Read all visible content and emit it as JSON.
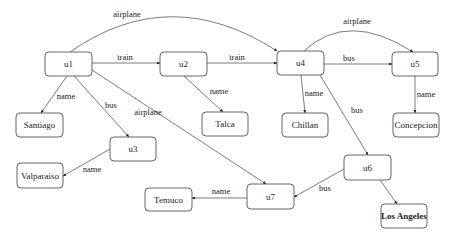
{
  "diagram": {
    "type": "graph",
    "nodes": [
      {
        "id": "u1",
        "label": "u1",
        "x": 45,
        "y": 52,
        "w": 47,
        "h": 24
      },
      {
        "id": "u2",
        "label": "u2",
        "x": 160,
        "y": 52,
        "w": 47,
        "h": 24
      },
      {
        "id": "u4",
        "label": "u4",
        "x": 277,
        "y": 51,
        "w": 47,
        "h": 24
      },
      {
        "id": "u5",
        "label": "u5",
        "x": 392,
        "y": 52,
        "w": 46,
        "h": 24
      },
      {
        "id": "santiago",
        "label": "Santiago",
        "x": 16,
        "y": 113,
        "w": 47,
        "h": 24
      },
      {
        "id": "talca",
        "label": "Talca",
        "x": 202,
        "y": 112,
        "w": 46,
        "h": 24
      },
      {
        "id": "chillan",
        "label": "Chillan",
        "x": 282,
        "y": 113,
        "w": 46,
        "h": 24
      },
      {
        "id": "concepcion",
        "label": "Concepcion",
        "x": 393,
        "y": 113,
        "w": 46,
        "h": 24
      },
      {
        "id": "u3",
        "label": "u3",
        "x": 110,
        "y": 137,
        "w": 46,
        "h": 24
      },
      {
        "id": "valparaiso",
        "label": "Valparaiso",
        "x": 17,
        "y": 163,
        "w": 46,
        "h": 25
      },
      {
        "id": "u6",
        "label": "u6",
        "x": 344,
        "y": 155,
        "w": 47,
        "h": 25
      },
      {
        "id": "u7",
        "label": "u7",
        "x": 247,
        "y": 184,
        "w": 47,
        "h": 25
      },
      {
        "id": "temuco",
        "label": "Temuco",
        "x": 145,
        "y": 188,
        "w": 47,
        "h": 23
      },
      {
        "id": "los_angeles",
        "label": "Los Angeles",
        "x": 381,
        "y": 204,
        "w": 46,
        "h": 24,
        "bold": true
      }
    ],
    "edges": [
      {
        "from": "u1",
        "to": "u4",
        "label": "airplane",
        "path": "M70,52 Q170,-18 277,51",
        "lx": 127,
        "ly": 17
      },
      {
        "from": "u1",
        "to": "u2",
        "label": "train",
        "path": "M92,63 L160,63",
        "lx": 125,
        "ly": 60
      },
      {
        "from": "u2",
        "to": "u4",
        "label": "train",
        "path": "M207,63 L277,63",
        "lx": 237,
        "ly": 60
      },
      {
        "from": "u4",
        "to": "u5",
        "label": "airplane",
        "path": "M304,51 Q348,10 413,52",
        "lx": 357,
        "ly": 24
      },
      {
        "from": "u4",
        "to": "u5",
        "label": "bus",
        "path": "M324,64 L392,64",
        "lx": 349,
        "ly": 61
      },
      {
        "from": "u1",
        "to": "santiago",
        "label": "name",
        "path": "M67,76 L41,113",
        "lx": 66,
        "ly": 99
      },
      {
        "from": "u1",
        "to": "u3",
        "label": "bus",
        "path": "M74,76 L129,137",
        "lx": 111,
        "ly": 108
      },
      {
        "from": "u1",
        "to": "u7",
        "label": "airplane",
        "path": "M92,70 L266,184",
        "lx": 148,
        "ly": 115
      },
      {
        "from": "u2",
        "to": "talca",
        "label": "name",
        "path": "M184,76 L223,112",
        "lx": 219,
        "ly": 94
      },
      {
        "from": "u4",
        "to": "chillan",
        "label": "name",
        "path": "M301,75 L305,113",
        "lx": 314,
        "ly": 96
      },
      {
        "from": "u4",
        "to": "u6",
        "label": "bus",
        "path": "M320,75 L368,155",
        "lx": 357,
        "ly": 113
      },
      {
        "from": "u5",
        "to": "concepcion",
        "label": "name",
        "path": "M415,76 L415,113",
        "lx": 426,
        "ly": 97
      },
      {
        "from": "u3",
        "to": "valparaiso",
        "label": "name",
        "path": "M110,149 L63,176",
        "lx": 92,
        "ly": 172
      },
      {
        "from": "u6",
        "to": "u7",
        "label": "bus",
        "path": "M344,169 L294,197",
        "lx": 325,
        "ly": 191
      },
      {
        "from": "u6",
        "to": "los_angeles",
        "label": "",
        "path": "M380,180 L397,204",
        "lx": 0,
        "ly": 0
      },
      {
        "from": "u7",
        "to": "temuco",
        "label": "name",
        "path": "M247,198 L192,198",
        "lx": 221,
        "ly": 194
      }
    ]
  }
}
